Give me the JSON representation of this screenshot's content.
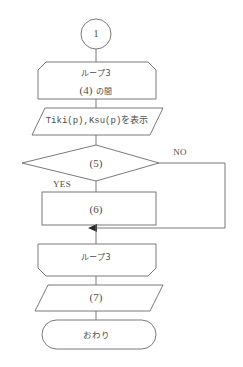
{
  "diagram": {
    "kind": "flowchart",
    "language": "ja",
    "background_color": "#ffffff",
    "line_color": "#6b6b6b",
    "text_color": "#4d4d4d",
    "nodes": {
      "connector_in": {
        "shape": "circle",
        "label": "1"
      },
      "loop_start": {
        "shape": "loop-start",
        "title": "ループ3",
        "condition_number": "(4)",
        "condition_suffix": "の間"
      },
      "output_display": {
        "shape": "parallelogram",
        "label": "Tiki(p),Ksu(p)を表示"
      },
      "decision": {
        "shape": "diamond",
        "label": "(5)"
      },
      "process": {
        "shape": "rectangle",
        "label": "(6)"
      },
      "loop_end": {
        "shape": "loop-end",
        "title": "ループ3"
      },
      "output_final": {
        "shape": "parallelogram",
        "label": "(7)"
      },
      "terminator": {
        "shape": "stadium",
        "label": "おわり"
      }
    },
    "branch_labels": {
      "yes": "YES",
      "no": "NO"
    }
  }
}
